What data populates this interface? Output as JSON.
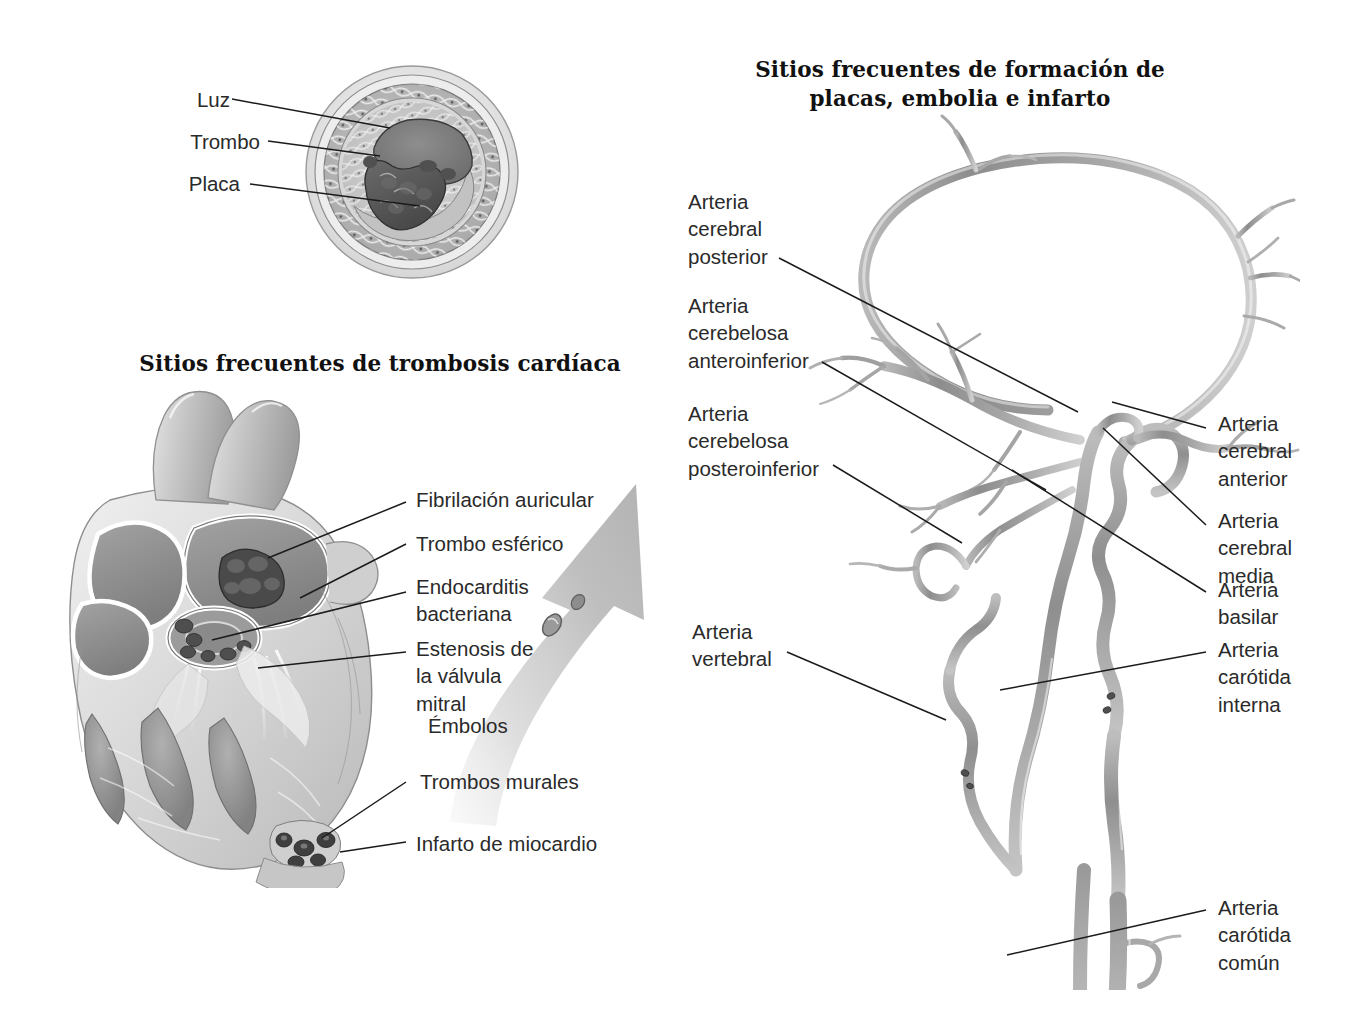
{
  "figure": {
    "language": "es",
    "background_color": "#ffffff",
    "ink_color": "#1b1b1b"
  },
  "panels": {
    "vessel_cross_section": {
      "name": "Corte transversal de vaso con placa y trombo",
      "labels": [
        {
          "id": "luz",
          "text": "Luz"
        },
        {
          "id": "trombo",
          "text": "Trombo"
        },
        {
          "id": "placa",
          "text": "Placa"
        }
      ]
    },
    "heart": {
      "title": "Sitios frecuentes de trombosis cardíaca",
      "labels": [
        {
          "id": "fibrilacion-auricular",
          "text": "Fibrilación auricular"
        },
        {
          "id": "trombo-esferico",
          "text": "Trombo esférico"
        },
        {
          "id": "endocarditis",
          "text": "Endocarditis\nbacteriana"
        },
        {
          "id": "estenosis-mitral",
          "text": "Estenosis de\nla válvula\nmitral"
        },
        {
          "id": "embolos",
          "text": "Émbolos"
        },
        {
          "id": "trombos-murales",
          "text": "Trombos murales"
        },
        {
          "id": "infarto-miocardio",
          "text": "Infarto de miocardio"
        }
      ]
    },
    "cerebral_arteries": {
      "title": "Sitios frecuentes de formación de placas,\nembolia e infarto",
      "labels_left": [
        {
          "id": "arteria-cerebral-posterior",
          "text": "Arteria\ncerebral\nposterior"
        },
        {
          "id": "arteria-cerebelosa-anteroinferior",
          "text": "Arteria\ncerebelosa\nanteroinferior"
        },
        {
          "id": "arteria-cerebelosa-posteroinferior",
          "text": "Arteria\ncerebelosa\nposteroinferior"
        },
        {
          "id": "arteria-vertebral",
          "text": "Arteria\nvertebral"
        }
      ],
      "labels_right": [
        {
          "id": "arteria-cerebral-anterior",
          "text": "Arteria\ncerebral\nanterior"
        },
        {
          "id": "arteria-cerebral-media",
          "text": "Arteria\ncerebral\nmedia"
        },
        {
          "id": "arteria-basilar",
          "text": "Arteria\nbasilar"
        },
        {
          "id": "arteria-carotida-interna",
          "text": "Arteria\ncarótida\ninterna"
        },
        {
          "id": "arteria-carotida-comun",
          "text": "Arteria\ncarótida\ncomún"
        }
      ]
    }
  }
}
